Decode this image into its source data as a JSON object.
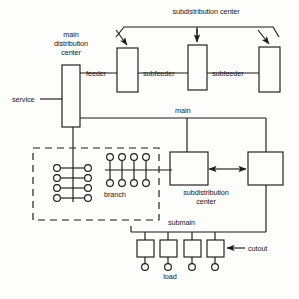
{
  "diagram": {
    "stroke_color": "#1b1b1b",
    "background_color": "#fdfdfc",
    "labels": {
      "main_distribution_center": "main\ndistribution\ncenter",
      "main_distribution_center_line1": "main",
      "main_distribution_center_line2": "distribution",
      "main_distribution_center_line3": "center",
      "subdistribution_center_top": "subdistribution center",
      "service": "service",
      "feeder": "feeder",
      "subfeeder_1": "subfeeder",
      "subfeeder_2": "subfeeder",
      "main": "main",
      "branch": "branch",
      "subdistribution_center_mid_line1": "subdistribution",
      "subdistribution_center_mid_line2": "center",
      "submain": "submain",
      "cutout": "cutout",
      "load": "load"
    },
    "nodes": {
      "main_distribution_center_box": {
        "x": 62,
        "y": 65,
        "w": 18,
        "h": 62
      },
      "feeder_box": {
        "x": 117,
        "y": 48,
        "w": 21,
        "h": 44
      },
      "subfeeder_box_1": {
        "x": 188,
        "y": 45,
        "w": 19,
        "h": 45
      },
      "subfeeder_box_2": {
        "x": 259,
        "y": 47,
        "w": 21,
        "h": 45
      },
      "subdistribution_box_left": {
        "x": 170,
        "y": 152,
        "w": 38,
        "h": 33
      },
      "subdistribution_box_right": {
        "x": 248,
        "y": 152,
        "w": 35,
        "h": 33
      },
      "load_box_1": {
        "x": 137,
        "y": 240,
        "w": 17,
        "h": 17
      },
      "load_box_2": {
        "x": 160,
        "y": 240,
        "w": 17,
        "h": 17
      },
      "load_box_3": {
        "x": 184,
        "y": 240,
        "w": 17,
        "h": 17
      },
      "load_box_4": {
        "x": 207,
        "y": 240,
        "w": 17,
        "h": 17
      }
    },
    "branch_enclosure": {
      "x": 33,
      "y": 148,
      "w": 126,
      "h": 72,
      "style": "dashed"
    },
    "branch_left_outlets": {
      "rows": 4,
      "left_x": 57,
      "right_x": 88,
      "bus_x": 73,
      "row_y": [
        168,
        178,
        188,
        198
      ],
      "radius": 3.4
    },
    "branch_right_outlets": {
      "count": 4,
      "stub_x": [
        110,
        122,
        134,
        146
      ],
      "top_y": 157,
      "bottom_y": 183,
      "bus_y": 170,
      "radius": 3.4
    },
    "load_terminals": {
      "x": [
        145,
        168,
        192,
        215
      ],
      "y": 267,
      "radius": 3.4
    },
    "buses": {
      "main_y": 118,
      "submain_y": 232,
      "service_y": 99,
      "feeder_y": 73,
      "subfeeder_y": 73
    },
    "arrows": {
      "subdistribution_fanout_count": 3,
      "bidirectional_mid": true,
      "cutout_pointer": true
    }
  }
}
